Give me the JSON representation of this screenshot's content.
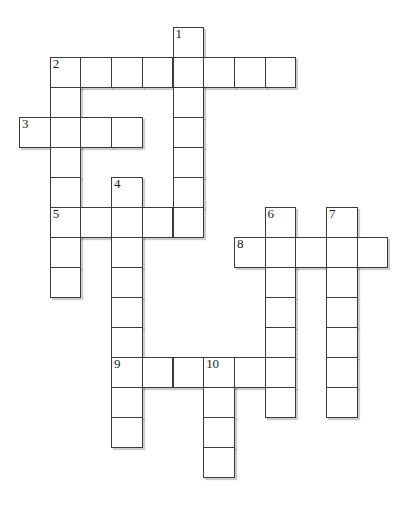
{
  "puzzle": {
    "type": "crossword-grid",
    "title": "Crossword puzzle grid",
    "geometry": {
      "origin_x": 19,
      "origin_y": 27,
      "cell_width": 30.7,
      "cell_height": 30,
      "columns": 13,
      "rows": 17
    },
    "colors": {
      "cell_fill": "#ffffff",
      "cell_border": "#3a3a3a",
      "shadow": "#5a5a5a",
      "number_text": "#1a1a1a",
      "background": "#ffffff"
    },
    "clue_numbers": [
      {
        "number": "1",
        "col": 5,
        "row": 0
      },
      {
        "number": "2",
        "col": 1,
        "row": 1
      },
      {
        "number": "3",
        "col": 0,
        "row": 3
      },
      {
        "number": "4",
        "col": 3,
        "row": 5
      },
      {
        "number": "5",
        "col": 1,
        "row": 6
      },
      {
        "number": "6",
        "col": 8,
        "row": 6
      },
      {
        "number": "7",
        "col": 10,
        "row": 6
      },
      {
        "number": "8",
        "col": 7,
        "row": 7
      },
      {
        "number": "9",
        "col": 3,
        "row": 11
      },
      {
        "number": "10",
        "col": 6,
        "row": 11
      }
    ],
    "entries": [
      {
        "number": "1",
        "direction": "down",
        "col": 5,
        "row": 0,
        "length": 7
      },
      {
        "number": "2",
        "direction": "across",
        "col": 1,
        "row": 1,
        "length": 8
      },
      {
        "number": "2",
        "direction": "down",
        "col": 1,
        "row": 1,
        "length": 8
      },
      {
        "number": "3",
        "direction": "across",
        "col": 0,
        "row": 3,
        "length": 4
      },
      {
        "number": "4",
        "direction": "down",
        "col": 3,
        "row": 5,
        "length": 7
      },
      {
        "number": "5",
        "direction": "across",
        "col": 1,
        "row": 6,
        "length": 5
      },
      {
        "number": "6",
        "direction": "down",
        "col": 8,
        "row": 6,
        "length": 7
      },
      {
        "number": "7",
        "direction": "down",
        "col": 10,
        "row": 6,
        "length": 7
      },
      {
        "number": "8",
        "direction": "across",
        "col": 7,
        "row": 7,
        "length": 5
      },
      {
        "number": "9",
        "direction": "across",
        "col": 3,
        "row": 11,
        "length": 6
      },
      {
        "number": "9",
        "direction": "down",
        "col": 3,
        "row": 11,
        "length": 3
      },
      {
        "number": "10",
        "direction": "down",
        "col": 6,
        "row": 11,
        "length": 4
      }
    ],
    "cells": [
      {
        "col": 5,
        "row": 0,
        "number": "1",
        "letter": ""
      },
      {
        "col": 1,
        "row": 1,
        "number": "2",
        "letter": ""
      },
      {
        "col": 2,
        "row": 1,
        "number": "",
        "letter": ""
      },
      {
        "col": 3,
        "row": 1,
        "number": "",
        "letter": ""
      },
      {
        "col": 4,
        "row": 1,
        "number": "",
        "letter": ""
      },
      {
        "col": 5,
        "row": 1,
        "number": "",
        "letter": ""
      },
      {
        "col": 6,
        "row": 1,
        "number": "",
        "letter": ""
      },
      {
        "col": 7,
        "row": 1,
        "number": "",
        "letter": ""
      },
      {
        "col": 8,
        "row": 1,
        "number": "",
        "letter": ""
      },
      {
        "col": 1,
        "row": 2,
        "number": "",
        "letter": ""
      },
      {
        "col": 5,
        "row": 2,
        "number": "",
        "letter": ""
      },
      {
        "col": 0,
        "row": 3,
        "number": "3",
        "letter": ""
      },
      {
        "col": 1,
        "row": 3,
        "number": "",
        "letter": ""
      },
      {
        "col": 2,
        "row": 3,
        "number": "",
        "letter": ""
      },
      {
        "col": 3,
        "row": 3,
        "number": "",
        "letter": ""
      },
      {
        "col": 5,
        "row": 3,
        "number": "",
        "letter": ""
      },
      {
        "col": 1,
        "row": 4,
        "number": "",
        "letter": ""
      },
      {
        "col": 5,
        "row": 4,
        "number": "",
        "letter": ""
      },
      {
        "col": 1,
        "row": 5,
        "number": "",
        "letter": ""
      },
      {
        "col": 3,
        "row": 5,
        "number": "4",
        "letter": ""
      },
      {
        "col": 5,
        "row": 5,
        "number": "",
        "letter": ""
      },
      {
        "col": 1,
        "row": 6,
        "number": "5",
        "letter": ""
      },
      {
        "col": 2,
        "row": 6,
        "number": "",
        "letter": ""
      },
      {
        "col": 3,
        "row": 6,
        "number": "",
        "letter": ""
      },
      {
        "col": 4,
        "row": 6,
        "number": "",
        "letter": ""
      },
      {
        "col": 5,
        "row": 6,
        "number": "",
        "letter": ""
      },
      {
        "col": 8,
        "row": 6,
        "number": "6",
        "letter": ""
      },
      {
        "col": 10,
        "row": 6,
        "number": "7",
        "letter": ""
      },
      {
        "col": 1,
        "row": 7,
        "number": "",
        "letter": ""
      },
      {
        "col": 3,
        "row": 7,
        "number": "",
        "letter": ""
      },
      {
        "col": 7,
        "row": 7,
        "number": "8",
        "letter": ""
      },
      {
        "col": 8,
        "row": 7,
        "number": "",
        "letter": ""
      },
      {
        "col": 9,
        "row": 7,
        "number": "",
        "letter": ""
      },
      {
        "col": 10,
        "row": 7,
        "number": "",
        "letter": ""
      },
      {
        "col": 11,
        "row": 7,
        "number": "",
        "letter": ""
      },
      {
        "col": 1,
        "row": 8,
        "number": "",
        "letter": ""
      },
      {
        "col": 3,
        "row": 8,
        "number": "",
        "letter": ""
      },
      {
        "col": 8,
        "row": 8,
        "number": "",
        "letter": ""
      },
      {
        "col": 10,
        "row": 8,
        "number": "",
        "letter": ""
      },
      {
        "col": 3,
        "row": 9,
        "number": "",
        "letter": ""
      },
      {
        "col": 8,
        "row": 9,
        "number": "",
        "letter": ""
      },
      {
        "col": 10,
        "row": 9,
        "number": "",
        "letter": ""
      },
      {
        "col": 3,
        "row": 10,
        "number": "",
        "letter": ""
      },
      {
        "col": 8,
        "row": 10,
        "number": "",
        "letter": ""
      },
      {
        "col": 10,
        "row": 10,
        "number": "",
        "letter": ""
      },
      {
        "col": 3,
        "row": 11,
        "number": "9",
        "letter": ""
      },
      {
        "col": 4,
        "row": 11,
        "number": "",
        "letter": ""
      },
      {
        "col": 5,
        "row": 11,
        "number": "",
        "letter": ""
      },
      {
        "col": 6,
        "row": 11,
        "number": "10",
        "letter": ""
      },
      {
        "col": 7,
        "row": 11,
        "number": "",
        "letter": ""
      },
      {
        "col": 8,
        "row": 11,
        "number": "",
        "letter": ""
      },
      {
        "col": 10,
        "row": 11,
        "number": "",
        "letter": ""
      },
      {
        "col": 3,
        "row": 12,
        "number": "",
        "letter": ""
      },
      {
        "col": 6,
        "row": 12,
        "number": "",
        "letter": ""
      },
      {
        "col": 8,
        "row": 12,
        "number": "",
        "letter": ""
      },
      {
        "col": 10,
        "row": 12,
        "number": "",
        "letter": ""
      },
      {
        "col": 3,
        "row": 13,
        "number": "",
        "letter": ""
      },
      {
        "col": 6,
        "row": 13,
        "number": "",
        "letter": ""
      },
      {
        "col": 6,
        "row": 14,
        "number": "",
        "letter": ""
      }
    ]
  }
}
